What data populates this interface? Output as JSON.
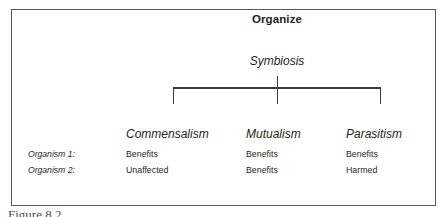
{
  "figure": {
    "title": "Organize",
    "subtitle": "Symbiosis",
    "caption": "Figure 8.2",
    "border_color": "#55585c",
    "text_color": "#231f20",
    "background_color": "#ffffff"
  },
  "table": {
    "row_labels": [
      "Organism 1:",
      "Organism 2:"
    ],
    "columns": [
      {
        "heading": "Commensalism",
        "cells": [
          "Benefits",
          "Unaffected"
        ]
      },
      {
        "heading": "Mutualism",
        "cells": [
          "Benefits",
          "Benefits"
        ]
      },
      {
        "heading": "Parasitism",
        "cells": [
          "Benefits",
          "Harmed"
        ]
      }
    ]
  }
}
